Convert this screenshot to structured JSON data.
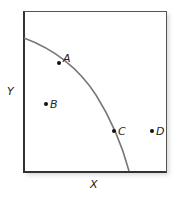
{
  "diagram": {
    "type": "production-possibilities-frontier",
    "axes": {
      "x_label": "X",
      "y_label": "Y"
    },
    "curve": {
      "description": "concave frontier from Y-axis to X-axis",
      "color": "#777777"
    },
    "points": [
      {
        "label": "A",
        "position": "on curve"
      },
      {
        "label": "B",
        "position": "inside curve"
      },
      {
        "label": "C",
        "position": "on curve"
      },
      {
        "label": "D",
        "position": "outside curve"
      }
    ]
  }
}
